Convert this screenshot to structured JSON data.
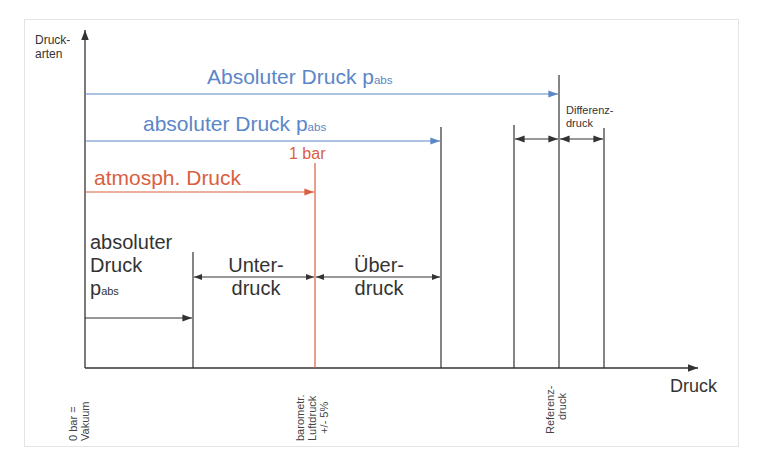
{
  "diagram": {
    "y_axis_label": [
      "Druck-",
      "arten"
    ],
    "x_axis_label": "Druck",
    "colors": {
      "blue": "#5b87c8",
      "red": "#d9603f",
      "black": "#333333"
    },
    "labels": {
      "absolute_upper": {
        "main": "Absoluter Druck p",
        "sub": "abs"
      },
      "absolute_lower": {
        "main": "absoluter Druck p",
        "sub": "abs"
      },
      "atmospheric": "atmosph. Druck",
      "one_bar": "1 bar",
      "differential": [
        "Differenz-",
        "druck"
      ],
      "absolute_left": {
        "line1": "absoluter",
        "line2": "Druck",
        "line3_main": "p",
        "line3_sub": "abs"
      },
      "underpressure": [
        "Unter-",
        "druck"
      ],
      "overpressure": [
        "Über-",
        "druck"
      ]
    },
    "axis_ticks": {
      "vacuum": [
        "0 bar =",
        "Vakuum"
      ],
      "barometric": [
        "barometr.",
        "Luftdruck",
        "+/- 5%"
      ],
      "reference": [
        "Referenz-",
        "druck"
      ]
    }
  }
}
